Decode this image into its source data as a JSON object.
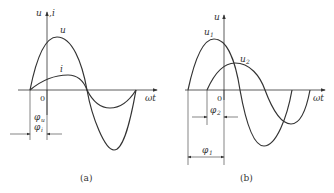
{
  "panels": [
    {
      "id": "a",
      "caption": "(a)",
      "y_axis_label_1": "u",
      "y_axis_label_sep": ",",
      "y_axis_label_2": "i",
      "x_axis_label": "ωt",
      "origin_label": "0",
      "curves": [
        {
          "name": "u",
          "label": "u",
          "relative_amplitude": "large",
          "phase": "φu"
        },
        {
          "name": "i",
          "label": "i",
          "relative_amplitude": "small",
          "phase": "φi"
        }
      ],
      "phase_labels": [
        "φu",
        "φi"
      ],
      "phase_label_1": "φ",
      "phase_label_1_sub": "u",
      "phase_label_2": "φ",
      "phase_label_2_sub": "i",
      "note": "u and i in phase (same initial phase φu = φi)"
    },
    {
      "id": "b",
      "caption": "(b)",
      "y_axis_label_1": "u",
      "x_axis_label": "ωt",
      "origin_label": "0",
      "curves": [
        {
          "name": "u1",
          "label": "u",
          "label_sub": "1",
          "relative_amplitude": "large",
          "phase": "φ1"
        },
        {
          "name": "u2",
          "label": "u",
          "label_sub": "2",
          "relative_amplitude": "small",
          "phase": "φ2"
        }
      ],
      "phase_label_1": "φ",
      "phase_label_1_sub": "2",
      "phase_label_2": "φ",
      "phase_label_2_sub": "1",
      "note": "u1 leads u2 (φ1 > φ2)"
    }
  ],
  "colors": {
    "stroke": "#333333",
    "background": "#ffffff"
  }
}
